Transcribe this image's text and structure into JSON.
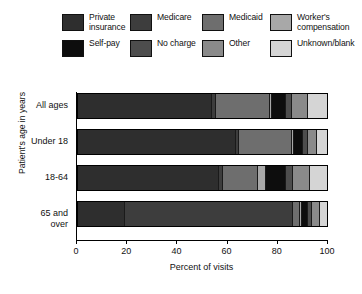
{
  "chart_data": {
    "type": "bar",
    "orientation": "horizontal",
    "stacked": true,
    "title": "",
    "xlabel": "Percent of visits",
    "ylabel": "Patient's age in years",
    "xlim": [
      0,
      100
    ],
    "xticks": [
      0,
      20,
      40,
      60,
      80,
      100
    ],
    "grid": false,
    "legend_position": "top",
    "categories": [
      "All ages",
      "Under 18",
      "18-64",
      "65 and over"
    ],
    "series": [
      {
        "name": "Private insurance",
        "color": "#2e2e2e",
        "values": [
          55.0,
          65.0,
          58.0,
          19.0
        ]
      },
      {
        "name": "Medicare",
        "color": "#3d3d3d",
        "values": [
          1.0,
          0.5,
          1.0,
          69.0
        ]
      },
      {
        "name": "Medicaid",
        "color": "#6e6e6e",
        "values": [
          22.0,
          21.5,
          14.0,
          2.5
        ]
      },
      {
        "name": "Worker's compensation",
        "color": "#a8a8a8",
        "values": [
          0.5,
          0.5,
          3.0,
          0.5
        ]
      },
      {
        "name": "Self-pay",
        "color": "#0d0d0d",
        "values": [
          5.5,
          3.5,
          8.0,
          2.0
        ]
      },
      {
        "name": "No charge",
        "color": "#4d4d4d",
        "values": [
          2.0,
          1.5,
          2.5,
          1.0
        ]
      },
      {
        "name": "Other",
        "color": "#8a8a8a",
        "values": [
          6.0,
          3.5,
          6.5,
          3.0
        ]
      },
      {
        "name": "Unknown/blank",
        "color": "#d5d5d5",
        "values": [
          8.0,
          4.0,
          7.0,
          3.0
        ]
      }
    ]
  },
  "legend": {
    "items": [
      {
        "label": "Private\ninsurance",
        "icon": "legend-swatch-private-insurance",
        "color": "#2e2e2e"
      },
      {
        "label": "Medicare",
        "icon": "legend-swatch-medicare",
        "color": "#3d3d3d"
      },
      {
        "label": "Medicaid",
        "icon": "legend-swatch-medicaid",
        "color": "#6e6e6e"
      },
      {
        "label": "Worker's\ncompensation",
        "icon": "legend-swatch-workers-compensation",
        "color": "#a8a8a8"
      },
      {
        "label": "Self-pay",
        "icon": "legend-swatch-self-pay",
        "color": "#0d0d0d"
      },
      {
        "label": "No charge",
        "icon": "legend-swatch-no-charge",
        "color": "#4d4d4d"
      },
      {
        "label": "Other",
        "icon": "legend-swatch-other",
        "color": "#8a8a8a"
      },
      {
        "label": "Unknown/blank",
        "icon": "legend-swatch-unknown-blank",
        "color": "#d5d5d5"
      }
    ]
  },
  "axes": {
    "y_title": "Patient's age in years",
    "x_title": "Percent of visits",
    "y_categories": [
      "All ages",
      "Under 18",
      "18-64",
      "65 and\nover"
    ],
    "x_tick_labels": [
      "0",
      "20",
      "40",
      "60",
      "80",
      "100"
    ]
  }
}
